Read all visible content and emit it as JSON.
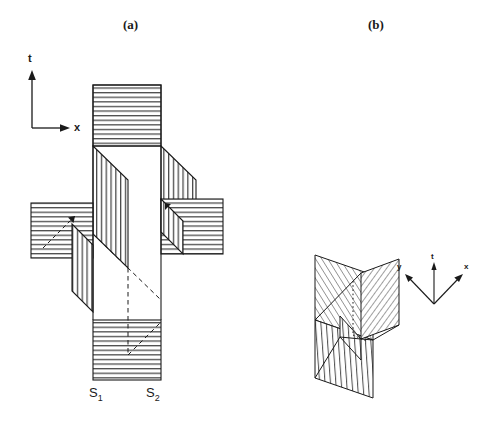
{
  "figure": {
    "panels": [
      {
        "id": "a",
        "caption": "(a)",
        "axes": {
          "vertical": "t",
          "horizontal": "x"
        },
        "surface_labels": [
          {
            "text": "S",
            "sub": "1"
          },
          {
            "text": "S",
            "sub": "2"
          }
        ],
        "description": "Two intersecting null surfaces drawn in x-t spacetime; horizontally hatched and vertically hatched regions meet along 45-degree light-cone edges, hidden edges dashed."
      },
      {
        "id": "b",
        "caption": "(b)",
        "axes": {
          "vertical": "t",
          "left": "y",
          "right": "x"
        },
        "description": "Three-dimensional perspective view of the same pair of intersecting surfaces, with diagonal, vertical and cross hatching marking each face."
      }
    ],
    "style": {
      "stroke": "#1a1a1a",
      "hatch": "#3a3a3a",
      "background": "#ffffff"
    }
  },
  "labels": {
    "caption_a": "(a)",
    "caption_b": "(b)",
    "axis_t_a": "t",
    "axis_x_a": "x",
    "axis_t_b": "t",
    "axis_y_b": "y",
    "axis_x_b": "x",
    "s1_main": "S",
    "s1_sub": "1",
    "s2_main": "S",
    "s2_sub": "2"
  }
}
